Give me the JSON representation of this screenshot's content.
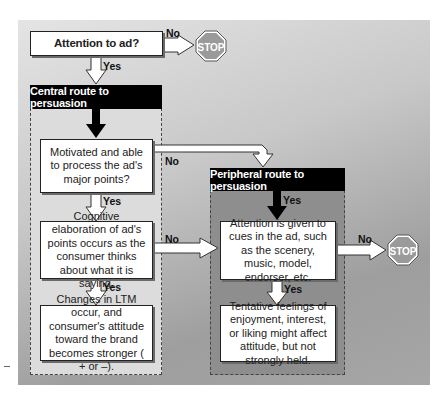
{
  "diagram": {
    "start": {
      "label": "Attention to ad?"
    },
    "stop_sign_text": "STOP",
    "labels": {
      "yes": "Yes",
      "no": "No"
    },
    "central_route": {
      "title": "Central route to persuasion",
      "steps": [
        {
          "text": "Motivated and able to process the ad's major points?"
        },
        {
          "text": "Cognitive elaboration of ad's points occurs as the consumer thinks about what it is saying."
        },
        {
          "text": "Changes in LTM occur, and consumer's attitude toward the brand becomes stronger ( + or –)."
        }
      ]
    },
    "peripheral_route": {
      "title": "Peripheral route to persuasion",
      "steps": [
        {
          "text": "Attention is given to cues in the ad, such as the scenery, music, model, endorser, etc."
        },
        {
          "text": "Tentative feelings of enjoyment, interest, or liking might affect attitude, but not strongly held."
        }
      ]
    },
    "colors": {
      "header_bg": "#000000",
      "central_panel": "#dcdcdc",
      "peripheral_panel": "#8c8c8c",
      "stop_sign": "#9a9a9a"
    }
  }
}
